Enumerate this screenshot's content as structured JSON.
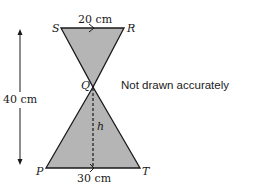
{
  "diagram": {
    "labels": {
      "S": "S",
      "R": "R",
      "Q": "Q",
      "P": "P",
      "T": "T",
      "h": "h"
    },
    "measurements": {
      "top_width": "20 cm",
      "bottom_width": "30 cm",
      "total_height": "40 cm"
    },
    "note": "Not drawn accurately",
    "colors": {
      "fill": "#b5b5b5",
      "stroke": "#1a1a1a"
    }
  }
}
